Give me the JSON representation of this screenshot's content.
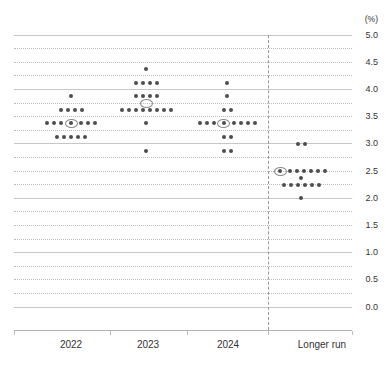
{
  "chart_data": {
    "type": "scatter",
    "subtype": "fomc-dot-plot",
    "title": "",
    "unit_label": "(%)",
    "y_axis": {
      "min": 0.0,
      "max": 5.0,
      "label_step": 0.5,
      "solid_gridline_step": 1.0,
      "dotted_gridline_step": 0.25,
      "side": "right",
      "tick_labels": [
        "5.0",
        "4.5",
        "4.0",
        "3.5",
        "3.0",
        "2.5",
        "2.0",
        "1.5",
        "1.0",
        "0.5",
        "0.0"
      ]
    },
    "categories": [
      "2022",
      "2023",
      "2024",
      "Longer run"
    ],
    "separator_after_category": "2024",
    "series": [
      {
        "category": "2022",
        "median": 3.375,
        "median_marker": "circled-dot",
        "rows": [
          {
            "value": 3.875,
            "count": 1
          },
          {
            "value": 3.625,
            "count": 4
          },
          {
            "value": 3.375,
            "count": 7,
            "median_index": 3
          },
          {
            "value": 3.125,
            "count": 5
          }
        ]
      },
      {
        "category": "2023",
        "median": 3.75,
        "median_marker": "ellipse-between-rows",
        "rows": [
          {
            "value": 4.375,
            "count": 1
          },
          {
            "value": 4.125,
            "count": 4
          },
          {
            "value": 3.875,
            "count": 4
          },
          {
            "value": 3.625,
            "count": 8
          },
          {
            "value": 3.375,
            "count": 1
          },
          {
            "value": 2.875,
            "count": 1
          }
        ]
      },
      {
        "category": "2024",
        "median": 3.375,
        "median_marker": "circled-dot",
        "rows": [
          {
            "value": 4.125,
            "count": 1
          },
          {
            "value": 3.875,
            "count": 1
          },
          {
            "value": 3.625,
            "count": 2
          },
          {
            "value": 3.375,
            "count": 8,
            "median_index": 3
          },
          {
            "value": 3.125,
            "count": 2
          },
          {
            "value": 2.875,
            "count": 2
          }
        ]
      },
      {
        "category": "Longer run",
        "median": 2.5,
        "median_marker": "circled-dot",
        "rows": [
          {
            "value": 3.0,
            "count": 2
          },
          {
            "value": 2.5,
            "count": 7,
            "median_index": 0
          },
          {
            "value": 2.375,
            "count": 1
          },
          {
            "value": 2.25,
            "count": 6
          },
          {
            "value": 2.0,
            "count": 1
          }
        ]
      }
    ],
    "layout": {
      "plot": {
        "top": 35,
        "bottom": 307,
        "left": 14,
        "right": 352
      },
      "axis_line_y": 330,
      "axis_tick_xs": [
        14,
        110,
        187,
        268,
        352
      ],
      "column_dot_centers_x": [
        71,
        146,
        227,
        301
      ],
      "column_label_centers_x": [
        71,
        148,
        228,
        322
      ],
      "label_row_y": 339,
      "separator_x": 268,
      "dot_spacing": 7,
      "dot_size": 4,
      "ring_w": 13,
      "ring_h": 9,
      "circled_gap": 3
    },
    "colors": {
      "dot": "#4d4d4d",
      "median_ring": "#8a8a8a",
      "solid_gridline": "#c6c6c6",
      "dotted_gridline": "#bdbdbd",
      "separator": "#999999",
      "axis_line": "#b3b3b3",
      "tick_label": "#333333",
      "category_label": "#333333",
      "background": "#ffffff"
    }
  }
}
